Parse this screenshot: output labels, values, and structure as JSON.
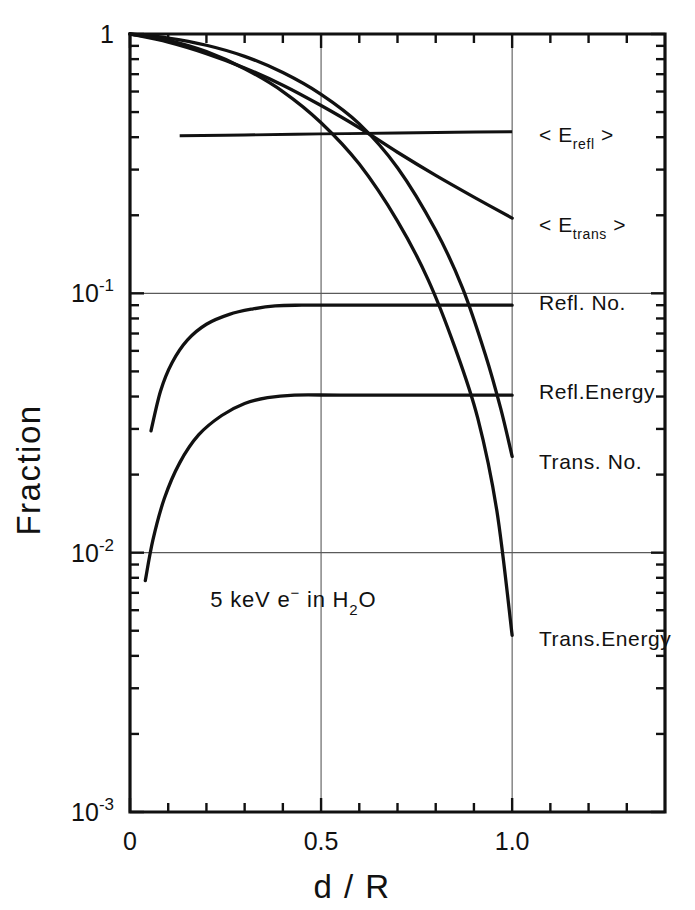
{
  "figure": {
    "background_color": "#ffffff",
    "ink_color": "#111111",
    "grid_color": "#5a5a5a"
  },
  "chart_data": {
    "type": "line",
    "title": "",
    "xlabel": "d / R",
    "ylabel": "Fraction",
    "xlim": [
      0,
      1.4
    ],
    "ylim": [
      0.001,
      1
    ],
    "yscale": "log",
    "xscale": "linear",
    "grid": true,
    "legend_position": "right-inline-labels",
    "annotations": [
      {
        "text": "5 keV e⁻ in H₂O",
        "parts": {
          "pre": "5 keV e",
          "sup": "−",
          "mid": " in  H",
          "sub": "2",
          "post": "O"
        },
        "x": 0.21,
        "y": 0.0062
      }
    ],
    "x_ticks_major": [
      {
        "value": 0,
        "label": "0"
      },
      {
        "value": 0.5,
        "label": "0.5"
      },
      {
        "value": 1.0,
        "label": "1.0"
      }
    ],
    "x_ticks_minor": [
      0.1,
      0.2,
      0.3,
      0.4,
      0.6,
      0.7,
      0.8,
      0.9,
      1.1,
      1.2,
      1.3
    ],
    "y_ticks_major": [
      {
        "value": 1,
        "mantissa": "1",
        "exponent": ""
      },
      {
        "value": 0.1,
        "mantissa": "10",
        "exponent": "-1"
      },
      {
        "value": 0.01,
        "mantissa": "10",
        "exponent": "-2"
      },
      {
        "value": 0.001,
        "mantissa": "10",
        "exponent": "-3"
      }
    ],
    "gridlines_y": [
      0.1,
      0.01
    ],
    "gridlines_x": [
      0.5,
      1.0
    ],
    "series": [
      {
        "name": "<E_refl>",
        "label_text": "< E",
        "label_sub": "refl",
        "label_close": " >",
        "label_x": 1.07,
        "label_y": 0.41,
        "shape": "nearly-flat",
        "points": [
          [
            0.13,
            0.405
          ],
          [
            0.3,
            0.408
          ],
          [
            0.5,
            0.412
          ],
          [
            0.7,
            0.415
          ],
          [
            0.85,
            0.418
          ],
          [
            1.0,
            0.42
          ]
        ]
      },
      {
        "name": "<E_trans>",
        "label_text": "< E",
        "label_sub": "trans",
        "label_close": " >",
        "label_x": 1.07,
        "label_y": 0.185,
        "shape": "decreasing",
        "points": [
          [
            0.0,
            1.0
          ],
          [
            0.1,
            0.93
          ],
          [
            0.2,
            0.84
          ],
          [
            0.3,
            0.74
          ],
          [
            0.4,
            0.635
          ],
          [
            0.5,
            0.53
          ],
          [
            0.6,
            0.435
          ],
          [
            0.7,
            0.35
          ],
          [
            0.8,
            0.285
          ],
          [
            0.9,
            0.235
          ],
          [
            1.0,
            0.195
          ]
        ]
      },
      {
        "name": "Refl. No.",
        "label_text": "Refl. No.",
        "label_x": 1.07,
        "label_y": 0.093,
        "shape": "rising-plateau",
        "plateau_value": 0.09,
        "points": [
          [
            0.055,
            0.0295
          ],
          [
            0.08,
            0.042
          ],
          [
            0.11,
            0.054
          ],
          [
            0.15,
            0.066
          ],
          [
            0.2,
            0.076
          ],
          [
            0.26,
            0.083
          ],
          [
            0.32,
            0.087
          ],
          [
            0.38,
            0.0895
          ],
          [
            0.45,
            0.09
          ],
          [
            0.6,
            0.09
          ],
          [
            0.8,
            0.09
          ],
          [
            1.0,
            0.09
          ]
        ]
      },
      {
        "name": "Refl. Energy",
        "label_text": "Refl.Energy",
        "label_x": 1.07,
        "label_y": 0.042,
        "shape": "rising-plateau",
        "plateau_value": 0.0405,
        "points": [
          [
            0.04,
            0.0078
          ],
          [
            0.06,
            0.0112
          ],
          [
            0.09,
            0.0162
          ],
          [
            0.13,
            0.0222
          ],
          [
            0.18,
            0.0285
          ],
          [
            0.24,
            0.0338
          ],
          [
            0.3,
            0.0376
          ],
          [
            0.36,
            0.0396
          ],
          [
            0.43,
            0.0405
          ],
          [
            0.55,
            0.0405
          ],
          [
            0.75,
            0.0405
          ],
          [
            1.0,
            0.0405
          ]
        ]
      },
      {
        "name": "Trans. No.",
        "label_text": "Trans. No.",
        "label_x": 1.07,
        "label_y": 0.0225,
        "shape": "decreasing-steep",
        "points": [
          [
            0.0,
            1.0
          ],
          [
            0.1,
            0.965
          ],
          [
            0.2,
            0.905
          ],
          [
            0.3,
            0.82
          ],
          [
            0.4,
            0.71
          ],
          [
            0.5,
            0.585
          ],
          [
            0.6,
            0.45
          ],
          [
            0.7,
            0.305
          ],
          [
            0.8,
            0.175
          ],
          [
            0.87,
            0.105
          ],
          [
            0.93,
            0.058
          ],
          [
            0.97,
            0.036
          ],
          [
            1.0,
            0.0235
          ]
        ]
      },
      {
        "name": "Trans. Energy",
        "label_text": "Trans.Energy",
        "label_x": 1.07,
        "label_y": 0.0047,
        "shape": "decreasing-steepest",
        "points": [
          [
            0.0,
            1.0
          ],
          [
            0.1,
            0.945
          ],
          [
            0.2,
            0.855
          ],
          [
            0.3,
            0.735
          ],
          [
            0.4,
            0.6
          ],
          [
            0.5,
            0.455
          ],
          [
            0.6,
            0.315
          ],
          [
            0.7,
            0.19
          ],
          [
            0.78,
            0.113
          ],
          [
            0.85,
            0.062
          ],
          [
            0.91,
            0.033
          ],
          [
            0.96,
            0.0145
          ],
          [
            1.0,
            0.0048
          ]
        ]
      }
    ]
  }
}
